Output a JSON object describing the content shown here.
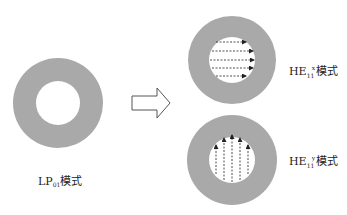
{
  "diagram": {
    "colors": {
      "cladding": "#a9a9a9",
      "core": "#ffffff",
      "arrow_stroke": "#555555",
      "field_line": "#222222"
    },
    "nodes": [
      {
        "id": "lp01",
        "label_main": "LP",
        "label_sub": "01",
        "label_suffix": "模式",
        "cx": 58,
        "cy": 103,
        "r_outer": 45,
        "r_inner": 22,
        "field": "none"
      },
      {
        "id": "he11x",
        "label_main": "HE",
        "label_sub": "11",
        "label_sup": "x",
        "label_suffix": "模式",
        "cx": 232,
        "cy": 60,
        "r_outer": 44,
        "r_inner": 23,
        "field": "horizontal-arrows"
      },
      {
        "id": "he11y",
        "label_main": "HE",
        "label_sub": "11",
        "label_sup": "y",
        "label_suffix": "模式",
        "cx": 232,
        "cy": 160,
        "r_outer": 45,
        "r_inner": 23,
        "field": "vertical-arrows"
      }
    ],
    "transition_arrow": {
      "from": "lp01",
      "to": [
        "he11x",
        "he11y"
      ],
      "style": "hollow-block-arrow"
    }
  }
}
